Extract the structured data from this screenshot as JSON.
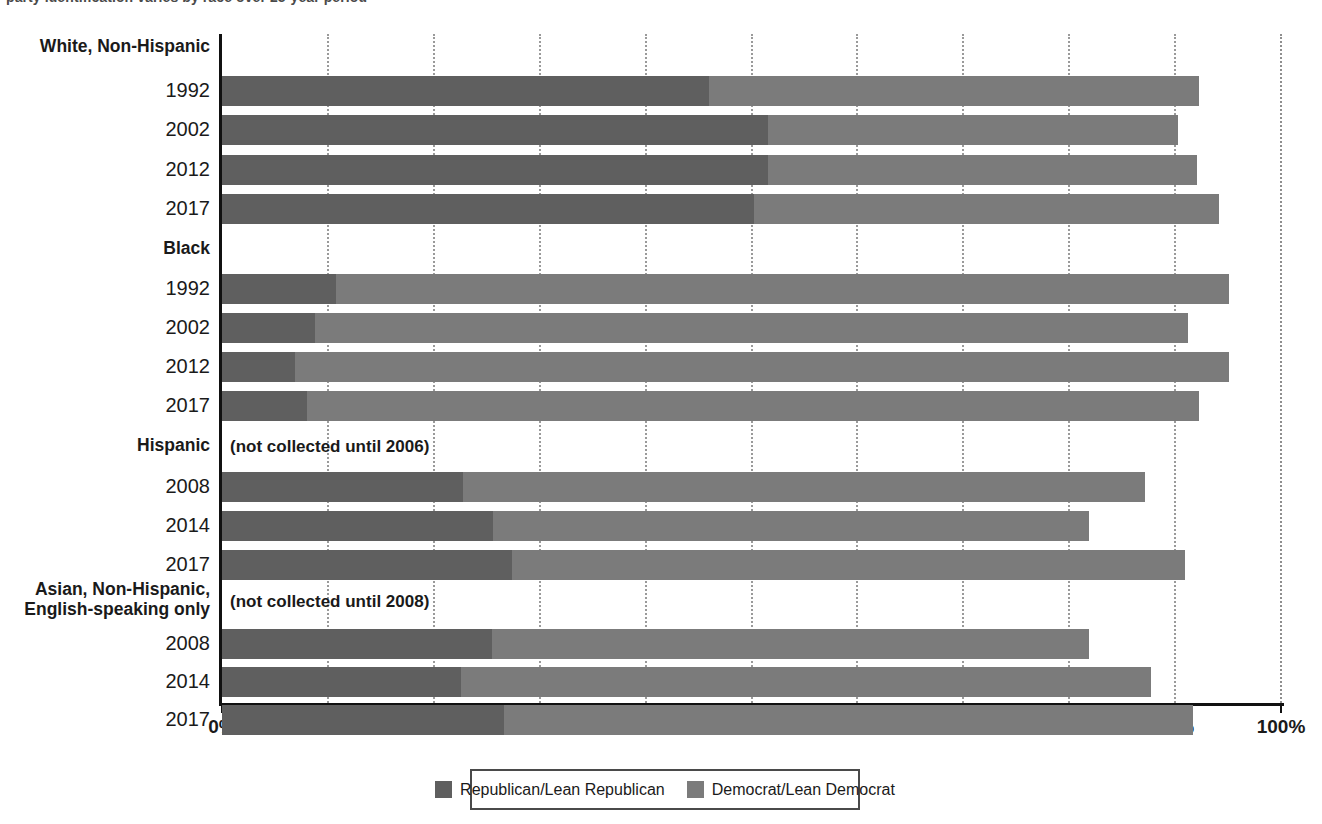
{
  "caption": {
    "text": "party identification varies by race over 25-year period"
  },
  "chart_data": {
    "type": "bar",
    "orientation": "horizontal",
    "stacked": true,
    "title": "",
    "xlabel": "",
    "ylabel": "",
    "xlim": [
      0,
      100
    ],
    "xticks": [
      "0%",
      "10%",
      "20%",
      "30%",
      "40%",
      "50%",
      "60%",
      "70%",
      "80%",
      "90%",
      "100%"
    ],
    "xtick_values": [
      0,
      10,
      20,
      30,
      40,
      50,
      60,
      70,
      80,
      90,
      100
    ],
    "grid": "vertical-dotted",
    "legend_position": "bottom-center",
    "series": [
      {
        "name": "Republican/Lean Republican",
        "color": "#5f5f5f"
      },
      {
        "name": "Democrat/Lean Democrat",
        "color": "#7b7b7b"
      }
    ],
    "groups": [
      {
        "label": "White, Non-Hispanic",
        "note": "",
        "rows": [
          {
            "year": "1992",
            "republican": 46.0,
            "democrat": 46.3,
            "total": 92.3
          },
          {
            "year": "2002",
            "republican": 51.6,
            "democrat": 38.7,
            "total": 90.3
          },
          {
            "year": "2012",
            "republican": 51.6,
            "democrat": 40.5,
            "total": 92.1
          },
          {
            "year": "2017",
            "republican": 50.2,
            "democrat": 43.9,
            "total": 94.1
          }
        ]
      },
      {
        "label": "Black",
        "note": "",
        "rows": [
          {
            "year": "1992",
            "republican": 10.8,
            "democrat": 84.3,
            "total": 95.1
          },
          {
            "year": "2002",
            "republican": 8.8,
            "democrat": 82.4,
            "total": 91.2
          },
          {
            "year": "2012",
            "republican": 6.9,
            "democrat": 88.2,
            "total": 95.1
          },
          {
            "year": "2017",
            "republican": 8.0,
            "democrat": 84.3,
            "total": 92.3
          }
        ]
      },
      {
        "label": "Hispanic",
        "note": "(not collected until 2006)",
        "rows": [
          {
            "year": "2008",
            "republican": 22.8,
            "democrat": 64.4,
            "total": 87.2
          },
          {
            "year": "2014",
            "republican": 25.6,
            "democrat": 56.3,
            "total": 81.9
          },
          {
            "year": "2017",
            "republican": 27.4,
            "democrat": 63.5,
            "total": 90.9
          }
        ]
      },
      {
        "label": "Asian, Non-Hispanic,\nEnglish-speaking only",
        "note": "(not collected until 2008)",
        "rows": [
          {
            "year": "2008",
            "republican": 25.5,
            "democrat": 56.4,
            "total": 81.9
          },
          {
            "year": "2014",
            "republican": 22.6,
            "democrat": 65.1,
            "total": 87.7
          },
          {
            "year": "2017",
            "republican": 26.6,
            "democrat": 65.1,
            "total": 91.7
          }
        ]
      }
    ]
  },
  "legend": {
    "items": [
      {
        "label": "Republican/Lean Republican",
        "color": "#5f5f5f"
      },
      {
        "label": "Democrat/Lean Democrat",
        "color": "#7b7b7b"
      }
    ]
  }
}
